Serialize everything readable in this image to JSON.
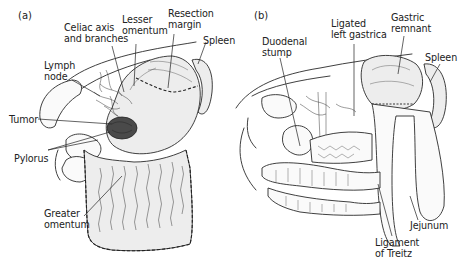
{
  "figure": {
    "panels": [
      {
        "id": "a",
        "panel_label": "(a)",
        "labels": {
          "celiac": "Celiac axis\nand branches",
          "lesser_omentum": "Lesser\nomentum",
          "resection_margin": "Resection\nmargin",
          "spleen": "Spleen",
          "lymph_node": "Lymph\nnode",
          "tumor": "Tumor",
          "pylorus": "Pylorus",
          "greater_omentum": "Greater\nomentum"
        }
      },
      {
        "id": "b",
        "panel_label": "(b)",
        "labels": {
          "duodenal_stump": "Duodenal\nstump",
          "ligated_left_gastrica": "Ligated\nleft gastrica",
          "gastric_remnant": "Gastric\nremnant",
          "spleen": "Spleen",
          "jejunum": "Jejunum",
          "ligament_of_treitz": "Ligament\nof Treitz"
        }
      }
    ],
    "colors": {
      "ink": "#2a2a2a",
      "tissue_fill": "#ededed",
      "tumor_fill": "#4a4a4a",
      "background": "#ffffff"
    }
  }
}
